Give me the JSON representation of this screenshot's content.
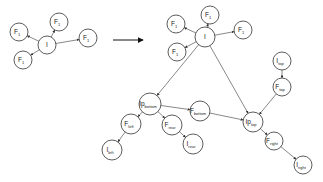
{
  "diagram": {
    "left_graph": {
      "nodes": [
        {
          "id": "I",
          "label": "I",
          "sub": "",
          "x": 47,
          "y": 45,
          "r": 9
        },
        {
          "id": "F1a",
          "label": "F",
          "sub": "1",
          "x": 19,
          "y": 32,
          "r": 9
        },
        {
          "id": "F1b",
          "label": "F",
          "sub": "1",
          "x": 59,
          "y": 22,
          "r": 9
        },
        {
          "id": "F1c",
          "label": "F",
          "sub": "1",
          "x": 88,
          "y": 38,
          "r": 9
        },
        {
          "id": "F1d",
          "label": "F",
          "sub": "1",
          "x": 23,
          "y": 60,
          "r": 9
        }
      ],
      "edges": [
        [
          "I",
          "F1a"
        ],
        [
          "I",
          "F1b"
        ],
        [
          "I",
          "F1c"
        ],
        [
          "I",
          "F1d"
        ]
      ]
    },
    "transform_arrow": {
      "from": [
        113,
        40
      ],
      "to": [
        143,
        40
      ]
    },
    "right_graph": {
      "nodes": [
        {
          "id": "I",
          "label": "I",
          "sub": "",
          "x": 205,
          "y": 37,
          "r": 10
        },
        {
          "id": "F1a",
          "label": "F",
          "sub": "1",
          "x": 176,
          "y": 24,
          "r": 9
        },
        {
          "id": "F1b",
          "label": "F",
          "sub": "1",
          "x": 210,
          "y": 15,
          "r": 9
        },
        {
          "id": "F1c",
          "label": "F",
          "sub": "1",
          "x": 243,
          "y": 30,
          "r": 9
        },
        {
          "id": "F1d",
          "label": "F",
          "sub": "1",
          "x": 177,
          "y": 52,
          "r": 9
        },
        {
          "id": "Ipbottom",
          "label": "Ip",
          "sub": "bottom",
          "x": 150,
          "y": 104,
          "r": 11
        },
        {
          "id": "Fbottom",
          "label": "F",
          "sub": "bottom",
          "x": 200,
          "y": 111,
          "r": 10
        },
        {
          "id": "Fleft",
          "label": "F",
          "sub": "left",
          "x": 131,
          "y": 124,
          "r": 10
        },
        {
          "id": "Frear",
          "label": "F",
          "sub": "rear",
          "x": 172,
          "y": 125,
          "r": 10
        },
        {
          "id": "Ileft",
          "label": "I",
          "sub": "left",
          "x": 112,
          "y": 150,
          "r": 10
        },
        {
          "id": "Irear",
          "label": "I",
          "sub": "rear",
          "x": 193,
          "y": 144,
          "r": 10
        },
        {
          "id": "Iptop",
          "label": "Ip",
          "sub": "top",
          "x": 253,
          "y": 122,
          "r": 10
        },
        {
          "id": "Itop",
          "label": "I",
          "sub": "top",
          "x": 282,
          "y": 61,
          "r": 9
        },
        {
          "id": "Ftop",
          "label": "F",
          "sub": "top",
          "x": 282,
          "y": 87,
          "r": 9
        },
        {
          "id": "Fright",
          "label": "F",
          "sub": "right",
          "x": 274,
          "y": 141,
          "r": 9
        },
        {
          "id": "Iright",
          "label": "I",
          "sub": "right",
          "x": 303,
          "y": 165,
          "r": 9
        }
      ],
      "edges": [
        [
          "I",
          "F1a"
        ],
        [
          "I",
          "F1b"
        ],
        [
          "I",
          "F1c"
        ],
        [
          "I",
          "F1d"
        ],
        [
          "I",
          "Ipbottom"
        ],
        [
          "I",
          "Iptop"
        ],
        [
          "Ipbottom",
          "Fbottom"
        ],
        [
          "Ipbottom",
          "Fleft"
        ],
        [
          "Ipbottom",
          "Frear"
        ],
        [
          "Fleft",
          "Ileft"
        ],
        [
          "Frear",
          "Irear"
        ],
        [
          "Fbottom",
          "Iptop"
        ],
        [
          "Itop",
          "Ftop"
        ],
        [
          "Ftop",
          "Iptop"
        ],
        [
          "Iptop",
          "Fright"
        ],
        [
          "Fright",
          "Iright"
        ]
      ]
    }
  }
}
